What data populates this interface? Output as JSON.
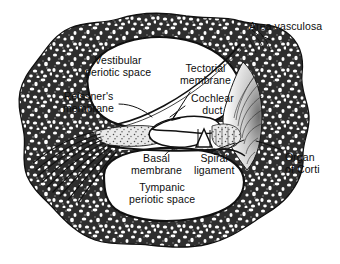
{
  "figure": {
    "style": "black-and-white stippled anatomical line drawing",
    "background_color": "#ffffff",
    "ink_color": "#111111"
  },
  "labels": {
    "area_vasculosa": "Area vasculosa",
    "vestibular_periotic_space": "Vestibular\nperiotic space",
    "reissners_membrane": "Reissner's\nmembrane",
    "tectorial_membrane": "Tectorial\nmembrane",
    "cochlear_duct": "Cochlear\nduct",
    "organ_of_corti": "Organ\nof Corti",
    "basal_membrane": "Basal\nmembrane",
    "spiral_ligament": "Spiral\nligament",
    "tympanic_periotic_space": "Tympanic\nperiotic space"
  },
  "structures": [
    {
      "name": "bony-labyrinth-wall",
      "description": "thick stippled spongy bone ring enclosing the section"
    },
    {
      "name": "vestibular-periotic-space",
      "description": "large upper fluid space (scala vestibuli)"
    },
    {
      "name": "tympanic-periotic-space",
      "description": "large lower fluid space (scala tympani)"
    },
    {
      "name": "cochlear-duct",
      "description": "small triangular central duct (scala media)"
    },
    {
      "name": "reissners-membrane",
      "description": "thin membrane roofing the cochlear duct"
    },
    {
      "name": "basal-membrane",
      "description": "basilar membrane floor of the cochlear duct"
    },
    {
      "name": "tectorial-membrane",
      "description": "flap overlying the organ of Corti"
    },
    {
      "name": "spiral-ligament",
      "description": "fan of radiating fibres on the outer wall"
    },
    {
      "name": "organ-of-corti",
      "description": "tunnel and hair-cell complex on the basilar membrane"
    },
    {
      "name": "cochlear-nerve-fibres",
      "description": "fan of nerve fibres leaving to the lower left"
    },
    {
      "name": "area-vasculosa",
      "description": "vascular area in the bone at upper right"
    }
  ]
}
